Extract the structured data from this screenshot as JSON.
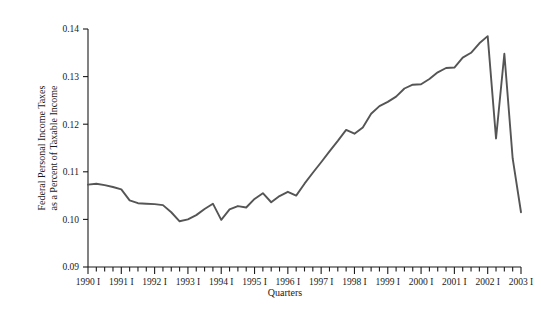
{
  "chart_data": {
    "type": "line",
    "title": "",
    "xlabel": "Quarters",
    "ylabel": "Federal Personal Income Taxes as a Percent of Taxable Income",
    "ylabel_line1": "Federal Personal Income Taxes",
    "ylabel_line2": "as a Percent of Taxable Income",
    "ylim": [
      0.09,
      0.14
    ],
    "ytick_values": [
      0.09,
      0.1,
      0.11,
      0.12,
      0.13,
      0.14
    ],
    "ytick_labels": [
      "0.09",
      "0.10",
      "0.11",
      "0.12",
      "0.13",
      "0.14"
    ],
    "xlim": [
      "1990 I",
      "2003 I"
    ],
    "xtick_labels": [
      "1990 I",
      "1991 I",
      "1992 I",
      "1993 I",
      "1994 I",
      "1995 I",
      "1996 I",
      "1997 I",
      "1998 I",
      "1999 I",
      "2000 I",
      "2001 I",
      "2002 I",
      "2003 I"
    ],
    "x_minor_ticks_per_label": 4,
    "grid": false,
    "legend": false,
    "line_color": "#555555",
    "axis_color": "#1a1a1a",
    "x": [
      "1990 I",
      "1990 II",
      "1990 III",
      "1990 IV",
      "1991 I",
      "1991 II",
      "1991 III",
      "1991 IV",
      "1992 I",
      "1992 II",
      "1992 III",
      "1992 IV",
      "1993 I",
      "1993 II",
      "1993 III",
      "1993 IV",
      "1994 I",
      "1994 II",
      "1994 III",
      "1994 IV",
      "1995 I",
      "1995 II",
      "1995 III",
      "1995 IV",
      "1996 I",
      "1996 II",
      "1996 III",
      "1996 IV",
      "1997 I",
      "1997 II",
      "1997 III",
      "1997 IV",
      "1998 I",
      "1998 II",
      "1998 III",
      "1998 IV",
      "1999 I",
      "1999 II",
      "1999 III",
      "1999 IV",
      "2000 I",
      "2000 II",
      "2000 III",
      "2000 IV",
      "2001 I",
      "2001 II",
      "2001 III",
      "2001 IV",
      "2002 I",
      "2002 II",
      "2002 III",
      "2002 IV",
      "2003 I"
    ],
    "values": [
      0.1073,
      0.1075,
      0.1072,
      0.1068,
      0.1063,
      0.104,
      0.1034,
      0.1033,
      0.1032,
      0.103,
      0.1015,
      0.0996,
      0.1,
      0.1009,
      0.1022,
      0.1033,
      0.0999,
      0.1021,
      0.1028,
      0.1025,
      0.1043,
      0.1055,
      0.1036,
      0.1049,
      0.1058,
      0.105,
      0.1075,
      0.1098,
      0.112,
      0.1143,
      0.1165,
      0.1188,
      0.118,
      0.1193,
      0.1222,
      0.1238,
      0.1247,
      0.1258,
      0.1275,
      0.1283,
      0.1284,
      0.1295,
      0.1309,
      0.1318,
      0.1319,
      0.134,
      0.135,
      0.137,
      0.1385,
      0.117,
      0.1348,
      0.1128,
      0.1015
    ],
    "series_note": "Quarterly series, 1990 Q1 through 2003 Q1"
  }
}
